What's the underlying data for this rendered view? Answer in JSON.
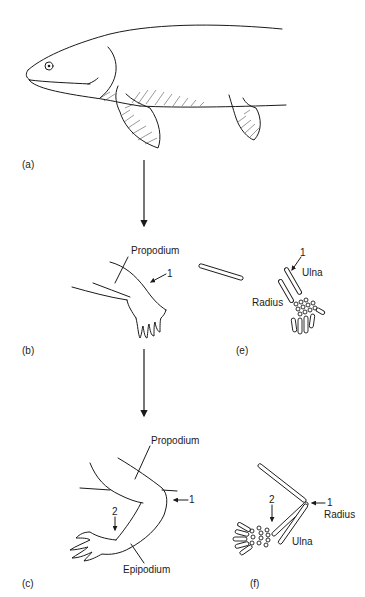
{
  "panels": {
    "a": {
      "label": "(a)",
      "subject": "lobe-finned fish"
    },
    "b": {
      "label": "(b)",
      "subject": "early limb",
      "labels": {
        "propodium": "Propodium",
        "marker_1": "1"
      }
    },
    "c": {
      "label": "(c)",
      "subject": "bent limb",
      "labels": {
        "propodium": "Propodium",
        "epipodium": "Epipodium",
        "marker_1": "1",
        "marker_2": "2"
      }
    },
    "e": {
      "label": "(e)",
      "subject": "skeleton of early limb",
      "labels": {
        "ulna": "Ulna",
        "radius": "Radius",
        "marker_1": "1"
      }
    },
    "f": {
      "label": "(f)",
      "subject": "skeleton of bent limb",
      "labels": {
        "radius": "Radius",
        "ulna": "Ulna",
        "marker_1": "1",
        "marker_2": "2"
      }
    }
  },
  "colors": {
    "ink": "#1a1a1a",
    "background": "#ffffff"
  }
}
